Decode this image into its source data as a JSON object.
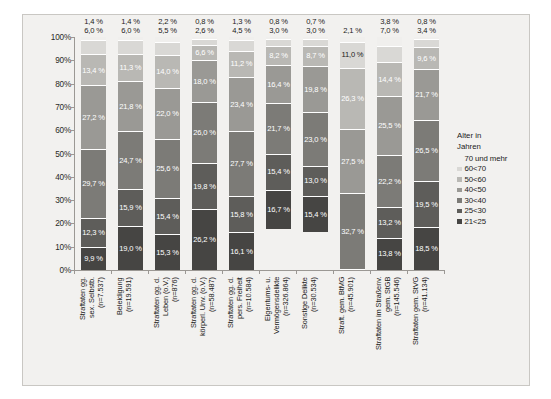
{
  "chart_data": {
    "type": "bar",
    "subtype": "stacked-100-percent",
    "title": "",
    "xlabel": "",
    "ylabel": "",
    "ylim": [
      0,
      100
    ],
    "ytick_labels": [
      "100%",
      "90%",
      "80%",
      "70%",
      "60%",
      "50%",
      "40%",
      "30%",
      "20%",
      "10%",
      "0%"
    ],
    "ytick_values": [
      100,
      90,
      80,
      70,
      60,
      50,
      40,
      30,
      20,
      10,
      0
    ],
    "grid": false,
    "legend_position": "right",
    "legend_title": "Alter in\nJahren",
    "categories": [
      "Straftaten gg.\nsex. Selbstb.\n(n=7.537)",
      "Beleidigung\n(n=19.591)",
      "Straftaten gg. d.\nLeben (o.V.)\n(n=876)",
      "Straftaten gg. d.\nkörperl. Unv. (o.V.)\n(n=58.487)",
      "Straftaten gg. d.\npers. Freiheit\n(n=10.584)",
      "Eigentums- u.\nVermögensdelikte\n(n=326.864)",
      "Sonstige Delikte\n(n=30.534)",
      "Straft. gem. BtMG\n(n=45.901)",
      "Straftaten im Straßenv.\ngem. StGB\n(n=145.546)",
      "Straftaten gem. StVG\n(n=41.134)"
    ],
    "series": [
      {
        "name": "70 und mehr",
        "color": "#f0efed",
        "label_color": "dark",
        "values": [
          1.4,
          1.4,
          2.2,
          0.8,
          1.3,
          0.8,
          0.7,
          2.1,
          3.8,
          0.8
        ]
      },
      {
        "name": "60<70",
        "color": "#d9d8d5",
        "label_color": "dark",
        "values": [
          6.0,
          6.0,
          5.5,
          2.6,
          4.5,
          3.0,
          3.0,
          11.0,
          7.0,
          3.4
        ]
      },
      {
        "name": "50<60",
        "color": "#b9b8b4",
        "label_color": "light",
        "values": [
          13.4,
          11.3,
          14.0,
          6.6,
          11.2,
          8.2,
          8.7,
          26.3,
          14.4,
          9.6
        ]
      },
      {
        "name": "40<50",
        "color": "#9a9995",
        "label_color": "light",
        "values": [
          27.2,
          21.8,
          22.0,
          18.0,
          23.4,
          16.4,
          19.8,
          27.5,
          25.5,
          21.7
        ]
      },
      {
        "name": "30<40",
        "color": "#7c7b77",
        "label_color": "light",
        "values": [
          29.7,
          24.7,
          25.6,
          26.0,
          27.7,
          21.7,
          23.0,
          32.7,
          22.2,
          26.5
        ]
      },
      {
        "name": "25<30",
        "color": "#5e5d5a",
        "label_color": "light",
        "values": [
          12.3,
          15.9,
          15.4,
          19.8,
          15.8,
          15.4,
          13.0,
          13.8,
          13.2,
          19.5
        ]
      },
      {
        "name": "21<25",
        "color": "#464543",
        "label_color": "light",
        "values": [
          9.9,
          19.0,
          15.3,
          26.2,
          16.1,
          16.7,
          15.4,
          13.8,
          13.8,
          18.5
        ]
      }
    ],
    "columns": [
      {
        "category": "Straftaten gg.\nsex. Selbstb.\n(n=7.537)",
        "n": 7537,
        "outside_labels": [
          "1,4 %",
          "6,0 %"
        ],
        "segments": [
          {
            "series": "70 und mehr",
            "value": 1.4,
            "label": "1,4 %",
            "label_outside": true
          },
          {
            "series": "60<70",
            "value": 6.0,
            "label": "6,0 %",
            "label_outside": true
          },
          {
            "series": "50<60",
            "value": 13.4,
            "label": "13,4 %",
            "label_outside": false
          },
          {
            "series": "40<50",
            "value": 27.2,
            "label": "27,2 %",
            "label_outside": false
          },
          {
            "series": "30<40",
            "value": 29.7,
            "label": "29,7 %",
            "label_outside": false
          },
          {
            "series": "25<30",
            "value": 12.3,
            "label": "12,3 %",
            "label_outside": false
          },
          {
            "series": "21<25",
            "value": 9.9,
            "label": "9,9 %",
            "label_outside": false
          }
        ]
      },
      {
        "category": "Beleidigung\n(n=19.591)",
        "n": 19591,
        "outside_labels": [
          "1,4 %",
          "6,0 %"
        ],
        "segments": [
          {
            "series": "70 und mehr",
            "value": 1.4,
            "label": "1,4 %",
            "label_outside": true
          },
          {
            "series": "60<70",
            "value": 6.0,
            "label": "6,0 %",
            "label_outside": true
          },
          {
            "series": "50<60",
            "value": 11.3,
            "label": "11,3 %",
            "label_outside": false
          },
          {
            "series": "40<50",
            "value": 21.8,
            "label": "21,8 %",
            "label_outside": false
          },
          {
            "series": "30<40",
            "value": 24.7,
            "label": "24,7 %",
            "label_outside": false
          },
          {
            "series": "25<30",
            "value": 15.9,
            "label": "15,9 %",
            "label_outside": false
          },
          {
            "series": "21<25",
            "value": 19.0,
            "label": "19,0 %",
            "label_outside": false
          }
        ]
      },
      {
        "category": "Straftaten gg. d.\nLeben (o.V.)\n(n=876)",
        "n": 876,
        "outside_labels": [
          "2,2 %",
          "5,5 %"
        ],
        "segments": [
          {
            "series": "70 und mehr",
            "value": 2.2,
            "label": "2,2 %",
            "label_outside": true
          },
          {
            "series": "60<70",
            "value": 5.5,
            "label": "5,5 %",
            "label_outside": true
          },
          {
            "series": "50<60",
            "value": 14.0,
            "label": "14,0 %",
            "label_outside": false
          },
          {
            "series": "40<50",
            "value": 22.0,
            "label": "22,0 %",
            "label_outside": false
          },
          {
            "series": "30<40",
            "value": 25.6,
            "label": "25,6 %",
            "label_outside": false
          },
          {
            "series": "25<30",
            "value": 15.4,
            "label": "15,4 %",
            "label_outside": false
          },
          {
            "series": "21<25",
            "value": 15.3,
            "label": "15,3 %",
            "label_outside": false
          }
        ]
      },
      {
        "category": "Straftaten gg. d.\nkörperl. Unv. (o.V.)\n(n=58.487)",
        "n": 58487,
        "outside_labels": [
          "0,8 %",
          "2,6 %"
        ],
        "segments": [
          {
            "series": "70 und mehr",
            "value": 0.8,
            "label": "0,8 %",
            "label_outside": true
          },
          {
            "series": "60<70",
            "value": 2.6,
            "label": "2,6 %",
            "label_outside": true
          },
          {
            "series": "50<60",
            "value": 6.6,
            "label": "6,6 %",
            "label_outside": false
          },
          {
            "series": "40<50",
            "value": 18.0,
            "label": "18,0 %",
            "label_outside": false
          },
          {
            "series": "30<40",
            "value": 26.0,
            "label": "26,0 %",
            "label_outside": false
          },
          {
            "series": "25<30",
            "value": 19.8,
            "label": "19,8 %",
            "label_outside": false
          },
          {
            "series": "21<25",
            "value": 26.2,
            "label": "26,2 %",
            "label_outside": false
          }
        ]
      },
      {
        "category": "Straftaten gg. d.\npers. Freiheit\n(n=10.584)",
        "n": 10584,
        "outside_labels": [
          "1,3 %",
          "4,5 %"
        ],
        "segments": [
          {
            "series": "70 und mehr",
            "value": 1.3,
            "label": "1,3 %",
            "label_outside": true
          },
          {
            "series": "60<70",
            "value": 4.5,
            "label": "4,5 %",
            "label_outside": true
          },
          {
            "series": "50<60",
            "value": 11.2,
            "label": "11,2 %",
            "label_outside": false
          },
          {
            "series": "40<50",
            "value": 23.4,
            "label": "23,4 %",
            "label_outside": false
          },
          {
            "series": "30<40",
            "value": 27.7,
            "label": "27,7 %",
            "label_outside": false
          },
          {
            "series": "25<30",
            "value": 15.8,
            "label": "15,8 %",
            "label_outside": false
          },
          {
            "series": "21<25",
            "value": 16.1,
            "label": "16,1 %",
            "label_outside": false
          }
        ]
      },
      {
        "category": "Eigentums- u.\nVermögensdelikte\n(n=326.864)",
        "n": 326864,
        "outside_labels": [
          "0,8 %",
          "3,0 %"
        ],
        "segments": [
          {
            "series": "70 und mehr",
            "value": 0.8,
            "label": "0,8 %",
            "label_outside": true
          },
          {
            "series": "60<70",
            "value": 3.0,
            "label": "3,0 %",
            "label_outside": true
          },
          {
            "series": "50<60",
            "value": 8.2,
            "label": "8,2 %",
            "label_outside": false
          },
          {
            "series": "40<50",
            "value": 16.4,
            "label": "16,4 %",
            "label_outside": false
          },
          {
            "series": "30<40",
            "value": 21.7,
            "label": "21,7 %",
            "label_outside": false
          },
          {
            "series": "25<30",
            "value": 15.4,
            "label": "15,4 %",
            "label_outside": false
          },
          {
            "series": "21<25",
            "value": 16.7,
            "label": "16,7 %",
            "label_outside": false
          }
        ]
      },
      {
        "category": "Sonstige Delikte\n(n=30.534)",
        "n": 30534,
        "outside_labels": [
          "0,7 %",
          "3,0 %"
        ],
        "segments": [
          {
            "series": "70 und mehr",
            "value": 0.7,
            "label": "0,7 %",
            "label_outside": true
          },
          {
            "series": "60<70",
            "value": 3.0,
            "label": "3,0 %",
            "label_outside": true
          },
          {
            "series": "50<60",
            "value": 8.7,
            "label": "8,7 %",
            "label_outside": false
          },
          {
            "series": "40<50",
            "value": 19.8,
            "label": "19,8 %",
            "label_outside": false
          },
          {
            "series": "30<40",
            "value": 23.0,
            "label": "23,0 %",
            "label_outside": false
          },
          {
            "series": "25<30",
            "value": 13.0,
            "label": "13,0 %",
            "label_outside": false
          },
          {
            "series": "21<25",
            "value": 15.4,
            "label": "15,4 %",
            "label_outside": false
          }
        ]
      },
      {
        "category": "Straft. gem. BtMG\n(n=45.901)",
        "n": 45901,
        "outside_labels": [
          "2,1 %"
        ],
        "segments": [
          {
            "series": "70 und mehr",
            "value": 2.1,
            "label": "2,1 %",
            "label_outside": true
          },
          {
            "series": "60<70",
            "value": 11.0,
            "label": "11,0 %",
            "label_outside": false
          },
          {
            "series": "50<60",
            "value": 26.3,
            "label": "26,3 %",
            "label_outside": false
          },
          {
            "series": "40<50",
            "value": 27.5,
            "label": "27,5 %",
            "label_outside": false
          },
          {
            "series": "30<40",
            "value": 32.7,
            "label": "32,7 %",
            "label_outside": false
          },
          {
            "series": "25<30",
            "value": 0.0,
            "label": "",
            "label_outside": false
          },
          {
            "series": "21<25",
            "value": 0.4,
            "label": "",
            "label_outside": false
          }
        ]
      },
      {
        "category": "Straftaten im Straßenv.\ngem. StGB\n(n=145.546)",
        "n": 145546,
        "outside_labels": [
          "3,8 %",
          "7,0 %"
        ],
        "segments": [
          {
            "series": "70 und mehr",
            "value": 3.8,
            "label": "3,8 %",
            "label_outside": true
          },
          {
            "series": "60<70",
            "value": 7.0,
            "label": "7,0 %",
            "label_outside": true
          },
          {
            "series": "50<60",
            "value": 14.4,
            "label": "14,4 %",
            "label_outside": false
          },
          {
            "series": "40<50",
            "value": 25.5,
            "label": "25,5 %",
            "label_outside": false
          },
          {
            "series": "30<40",
            "value": 22.2,
            "label": "22,2 %",
            "label_outside": false
          },
          {
            "series": "25<30",
            "value": 13.2,
            "label": "13,2 %",
            "label_outside": false
          },
          {
            "series": "21<25",
            "value": 13.8,
            "label": "13,8 %",
            "label_outside": false
          }
        ]
      },
      {
        "category": "Straftaten gem. StVG\n(n=41.134)",
        "n": 41134,
        "outside_labels": [
          "0,8 %",
          "3,4 %"
        ],
        "segments": [
          {
            "series": "70 und mehr",
            "value": 0.8,
            "label": "0,8 %",
            "label_outside": true
          },
          {
            "series": "60<70",
            "value": 3.4,
            "label": "3,4 %",
            "label_outside": true
          },
          {
            "series": "50<60",
            "value": 9.6,
            "label": "9,6 %",
            "label_outside": false
          },
          {
            "series": "40<50",
            "value": 21.7,
            "label": "21,7 %",
            "label_outside": false
          },
          {
            "series": "30<40",
            "value": 26.5,
            "label": "26,5 %",
            "label_outside": false
          },
          {
            "series": "25<30",
            "value": 19.5,
            "label": "19,5 %",
            "label_outside": false
          },
          {
            "series": "21<25",
            "value": 18.5,
            "label": "18,5 %",
            "label_outside": false
          }
        ]
      }
    ],
    "legend_entries": [
      {
        "label": "70 und mehr",
        "color": "#f0efed",
        "show_swatch": false
      },
      {
        "label": "60<70",
        "color": "#d9d8d5",
        "show_swatch": true
      },
      {
        "label": "50<60",
        "color": "#b9b8b4",
        "show_swatch": true
      },
      {
        "label": "40<50",
        "color": "#9a9995",
        "show_swatch": true
      },
      {
        "label": "30<40",
        "color": "#7c7b77",
        "show_swatch": true
      },
      {
        "label": "25<30",
        "color": "#5e5d5a",
        "show_swatch": true
      },
      {
        "label": "21<25",
        "color": "#464543",
        "show_swatch": true
      }
    ]
  }
}
